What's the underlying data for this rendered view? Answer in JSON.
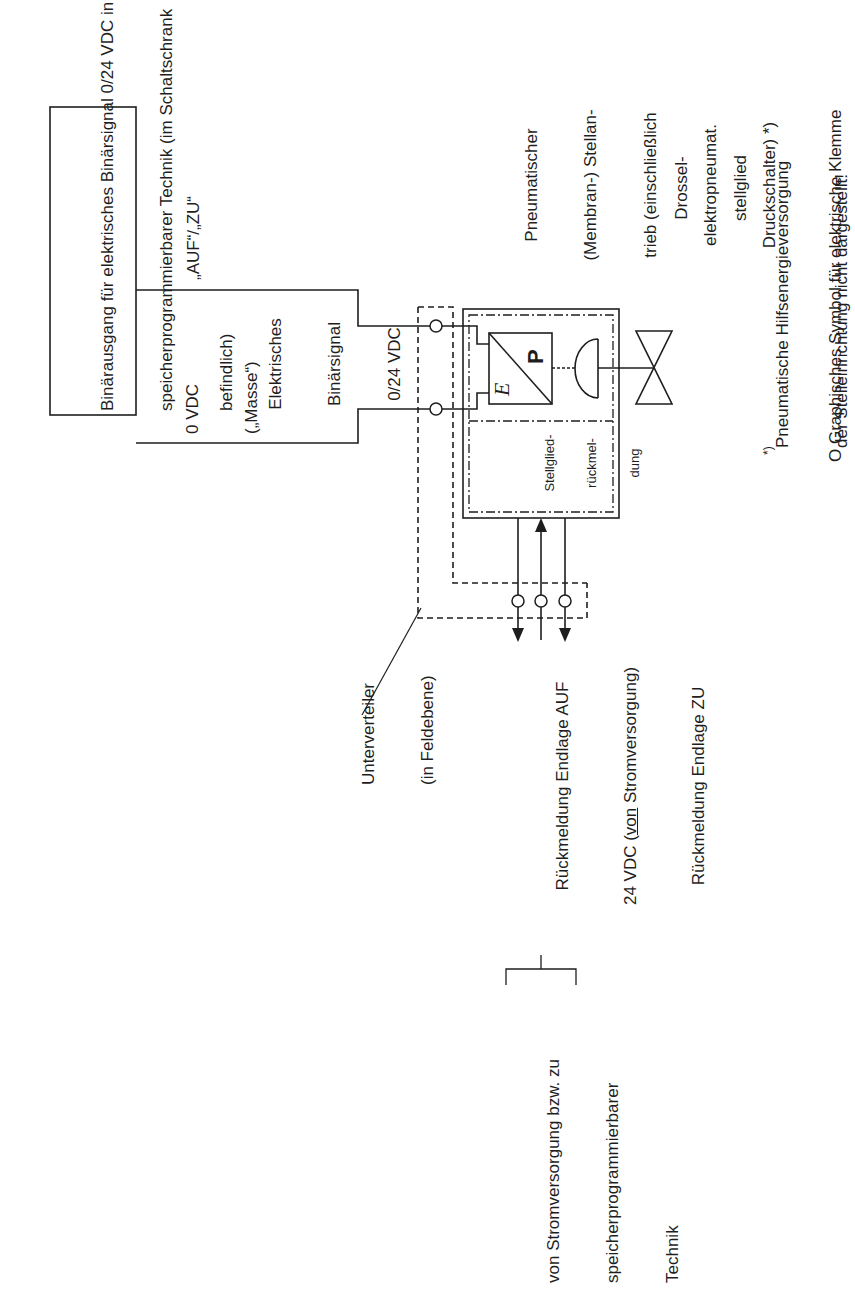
{
  "diagram": {
    "orientation": "rotated-90-ccw",
    "plc_box": {
      "lines": [
        "Binärausgang für elektrisches Binärsignal 0/24 VDC in",
        "speicherprogrammierbarer Technik (im Schaltschrank",
        "befindlich)"
      ]
    },
    "signal_labels": {
      "auf_zu": "„AUF“/„ZU“",
      "zero_vdc_line1": "0 VDC",
      "zero_vdc_line2": "(„Masse“)",
      "binary_signal": [
        "Elektrisches",
        "Binärsignal",
        "0/24 VDC"
      ]
    },
    "actuator": {
      "label": [
        "Pneumatischer",
        "(Membran-) Stellan-",
        "trieb (einschließlich",
        "elektropneumat.",
        "Druckschalter) *)"
      ],
      "ep_converter": {
        "input_symbol": "E",
        "output_symbol": "P"
      },
      "feedback_block": [
        "Stellglied-",
        "rückmel-",
        "dung"
      ]
    },
    "valve": {
      "label": [
        "Drossel-",
        "stellglied"
      ]
    },
    "sub_distributor": {
      "label": [
        "Unterverteiler",
        "(in Feldebene)"
      ]
    },
    "feedback_lines": {
      "line1": "Rückmeldung Endlage AUF",
      "line2_prefix": "24 VDC (",
      "line2_underlined": "von",
      "line2_suffix": " Stromversorgung)",
      "line3": "Rückmeldung Endlage ZU"
    },
    "bracket_label": [
      "von Stromversorgung bzw. zu",
      "speicherprogrammierbarer",
      "Technik"
    ],
    "footnotes": {
      "asterisk_marker": "*)",
      "asterisk_line1": "Pneumatische Hilfsenergieversorgung",
      "asterisk_line2": "der Stelleinrichtung nicht dargestellt!",
      "terminal_note": "O Graphisches Symbol für elektrische Klemme"
    },
    "colors": {
      "line": "#1e1e1e",
      "background": "#ffffff"
    }
  }
}
